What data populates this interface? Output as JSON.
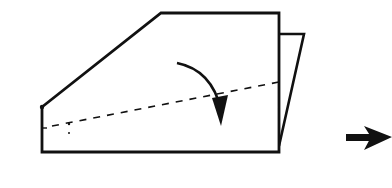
{
  "diagram": {
    "type": "origami-fold-step",
    "colors": {
      "line": "#111111",
      "background": "#ffffff"
    },
    "elements": {
      "paper_front": "front layer (pentagon shape)",
      "paper_back_flap": "back layer flap",
      "fold_line": "dashed valley-fold line",
      "fold_arrow": "curved arrow indicating fold direction",
      "next_step_arrow": "arrow pointing to next step"
    }
  }
}
